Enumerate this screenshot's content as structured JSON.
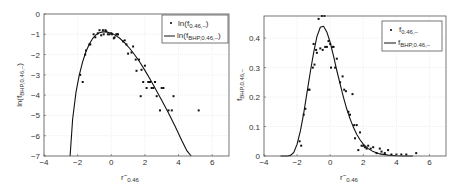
{
  "chart_data": [
    {
      "type": "scatter",
      "title": "",
      "xlabel": "r~_0.46",
      "ylabel": "ln(f_BHP,0.46,-)",
      "xlim": [
        -4,
        7
      ],
      "ylim": [
        -7,
        0
      ],
      "xticks": [
        -4,
        -2,
        0,
        2,
        4,
        6
      ],
      "yticks": [
        0,
        -1,
        -2,
        -3,
        -4,
        -5,
        -6,
        -7
      ],
      "grid": true,
      "legend_position": "upper right",
      "legend": [
        {
          "label": "ln(f_0.46,-)",
          "marker": "dot"
        },
        {
          "label": "ln(f_BHP,0.46,-)",
          "marker": "line"
        }
      ],
      "series": [
        {
          "name": "ln(f_0.46,-)",
          "kind": "points",
          "x": [
            -1.85,
            -1.7,
            -1.55,
            -1.5,
            -1.3,
            -1.25,
            -1.05,
            -0.95,
            -0.8,
            -0.7,
            -0.6,
            -0.5,
            -0.45,
            -0.35,
            -0.3,
            -0.2,
            -0.1,
            0.0,
            0.05,
            0.15,
            0.2,
            0.3,
            0.35,
            0.4,
            0.7,
            0.8,
            0.9,
            1.0,
            1.2,
            1.3,
            1.45,
            1.5,
            1.65,
            1.75,
            1.8,
            1.9,
            2.0,
            2.1,
            2.2,
            2.3,
            2.4,
            2.5,
            2.6,
            2.7,
            2.9,
            3.0,
            3.1,
            3.4,
            3.6,
            3.7,
            5.2
          ],
          "y": [
            -3.0,
            -3.35,
            -2.0,
            -1.8,
            -1.5,
            -1.5,
            -1.0,
            -1.15,
            -0.95,
            -0.8,
            -1.05,
            -0.8,
            -1.0,
            -0.8,
            -0.85,
            -1.0,
            -1.0,
            -0.95,
            -1.0,
            -1.2,
            -1.15,
            -1.0,
            -1.0,
            -1.0,
            -1.35,
            -1.3,
            -1.5,
            -1.95,
            -1.9,
            -1.6,
            -2.25,
            -2.8,
            -2.25,
            -4.05,
            -2.75,
            -3.35,
            -2.55,
            -3.65,
            -3.35,
            -3.35,
            -3.65,
            -3.65,
            -3.35,
            -4.05,
            -4.75,
            -3.65,
            -3.65,
            -4.75,
            -4.75,
            -4.05,
            -4.75
          ]
        },
        {
          "name": "ln(f_BHP,0.46,-)",
          "kind": "line",
          "x": [
            -2.45,
            -2.3,
            -2.1,
            -1.9,
            -1.7,
            -1.5,
            -1.3,
            -1.1,
            -0.9,
            -0.7,
            -0.5,
            -0.3,
            -0.1,
            0.1,
            0.3,
            0.5,
            0.8,
            1.1,
            1.4,
            1.7,
            2.0,
            2.3,
            2.6,
            3.0,
            3.4,
            3.8,
            4.2,
            4.5,
            4.75
          ],
          "y": [
            -7.0,
            -5.2,
            -3.85,
            -3.0,
            -2.35,
            -1.85,
            -1.48,
            -1.2,
            -1.02,
            -0.92,
            -0.88,
            -0.88,
            -0.92,
            -0.98,
            -1.08,
            -1.2,
            -1.42,
            -1.7,
            -2.02,
            -2.38,
            -2.78,
            -3.2,
            -3.65,
            -4.25,
            -4.88,
            -5.55,
            -6.25,
            -6.75,
            -7.0
          ]
        }
      ]
    },
    {
      "type": "scatter",
      "title": "",
      "xlabel": "r~_0.46",
      "ylabel": "f_BHP,0.46,-",
      "xlim": [
        -4,
        7
      ],
      "ylim": [
        0,
        0.475
      ],
      "xticks": [
        -4,
        -2,
        0,
        2,
        4,
        6
      ],
      "yticks": [
        0,
        0.1,
        0.2,
        0.3,
        0.4
      ],
      "grid": true,
      "legend_position": "upper right",
      "legend": [
        {
          "label": "f_0.46,-",
          "marker": "dot"
        },
        {
          "label": "f_BHP,0.46,-",
          "marker": "line"
        }
      ],
      "series": [
        {
          "name": "f_0.46,-",
          "kind": "points",
          "x": [
            -1.85,
            -1.75,
            -1.6,
            -1.5,
            -1.3,
            -1.25,
            -1.05,
            -1.0,
            -0.95,
            -0.85,
            -0.8,
            -0.7,
            -0.6,
            -0.5,
            -0.45,
            -0.35,
            -0.3,
            -0.2,
            -0.1,
            0.0,
            0.05,
            0.15,
            0.2,
            0.3,
            0.4,
            0.6,
            0.75,
            0.85,
            0.95,
            1.1,
            1.2,
            1.35,
            1.45,
            1.5,
            1.6,
            1.7,
            1.8,
            1.9,
            2.0,
            2.1,
            2.2,
            2.3,
            2.45,
            2.6,
            2.8,
            3.0,
            3.1,
            3.3,
            3.5,
            3.7,
            4.0,
            4.3,
            4.6,
            5.2
          ],
          "y": [
            0.05,
            0.035,
            0.14,
            0.16,
            0.225,
            0.225,
            0.3,
            0.38,
            0.31,
            0.36,
            0.35,
            0.465,
            0.365,
            0.475,
            0.36,
            0.475,
            0.37,
            0.37,
            0.39,
            0.38,
            0.3,
            0.37,
            0.37,
            0.3,
            0.33,
            0.25,
            0.27,
            0.225,
            0.22,
            0.15,
            0.14,
            0.21,
            0.105,
            0.06,
            0.105,
            0.02,
            0.08,
            0.035,
            0.035,
            0.03,
            0.025,
            0.035,
            0.025,
            0.03,
            0.01,
            0.025,
            0.015,
            0.01,
            0.02,
            0.005,
            0.005,
            0.005,
            0.005,
            0.01
          ]
        },
        {
          "name": "f_BHP,0.46,-",
          "kind": "line",
          "x": [
            -3.0,
            -2.6,
            -2.4,
            -2.2,
            -2.0,
            -1.8,
            -1.6,
            -1.4,
            -1.2,
            -1.0,
            -0.8,
            -0.6,
            -0.4,
            -0.2,
            0.0,
            0.2,
            0.4,
            0.6,
            0.8,
            1.0,
            1.2,
            1.4,
            1.6,
            1.8,
            2.0,
            2.3,
            2.6,
            3.0,
            3.5,
            4.0,
            4.5,
            5.0
          ],
          "y": [
            0.0,
            0.0,
            0.002,
            0.012,
            0.04,
            0.085,
            0.145,
            0.215,
            0.285,
            0.35,
            0.405,
            0.437,
            0.44,
            0.42,
            0.385,
            0.34,
            0.29,
            0.245,
            0.2,
            0.16,
            0.127,
            0.098,
            0.074,
            0.055,
            0.04,
            0.025,
            0.015,
            0.007,
            0.003,
            0.001,
            0.0,
            0.0
          ]
        }
      ]
    }
  ]
}
